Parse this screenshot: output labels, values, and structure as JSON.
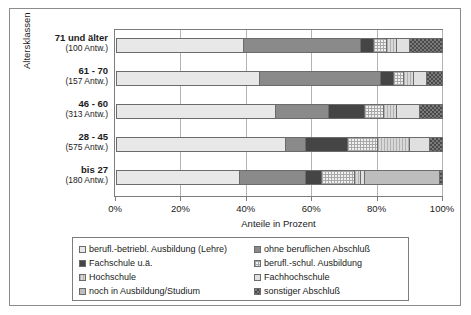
{
  "chart_data": {
    "type": "bar",
    "orientation": "horizontal",
    "stacked": true,
    "title": "",
    "xlabel": "Anteile in Prozent",
    "ylabel": "Altersklassen",
    "xlim": [
      0,
      100
    ],
    "xticks": [
      "0%",
      "20%",
      "40%",
      "60%",
      "80%",
      "100%"
    ],
    "xtick_values": [
      0,
      20,
      40,
      60,
      80,
      100
    ],
    "grid": true,
    "legend_position": "bottom",
    "categories": [
      "71 und älter",
      "61 - 70",
      "46 - 60",
      "28 - 45",
      "bis 27"
    ],
    "category_counts": [
      "(100 Antw.)",
      "(157 Antw.)",
      "(313 Antw.)",
      "(575 Antw.)",
      "(180 Antw.)"
    ],
    "series": [
      {
        "name": "berufl.-betriebl. Ausbildung (Lehre)",
        "pattern": "p-lehre",
        "values": [
          39,
          44,
          49,
          52,
          38
        ]
      },
      {
        "name": "ohne beruflichen Abschluß",
        "pattern": "p-ohne",
        "values": [
          36,
          37,
          16,
          6,
          20
        ]
      },
      {
        "name": "Fachschule u.ä.",
        "pattern": "p-fachsch",
        "values": [
          4,
          4,
          11,
          13,
          5
        ]
      },
      {
        "name": "berufl.-schul. Ausbildung",
        "pattern": "p-beschul",
        "values": [
          4,
          3,
          6,
          9,
          10
        ]
      },
      {
        "name": "Hochschule",
        "pattern": "p-hoch",
        "values": [
          3,
          3,
          4,
          10,
          2
        ]
      },
      {
        "name": "Fachhochschule",
        "pattern": "p-fachhoch",
        "values": [
          4,
          4,
          7,
          6,
          1
        ]
      },
      {
        "name": "noch in Ausbildung/Studium",
        "pattern": "p-noch",
        "values": [
          0,
          0,
          0,
          0,
          23
        ]
      },
      {
        "name": "sonstiger Abschluß",
        "pattern": "p-sonst",
        "values": [
          10,
          5,
          7,
          4,
          1
        ]
      }
    ]
  },
  "axes": {
    "x_title": "Anteile in Prozent",
    "y_title": "Altersklassen",
    "x_ticks": [
      {
        "label": "0%",
        "value": 0
      },
      {
        "label": "20%",
        "value": 20
      },
      {
        "label": "40%",
        "value": 40
      },
      {
        "label": "60%",
        "value": 60
      },
      {
        "label": "80%",
        "value": 80
      },
      {
        "label": "100%",
        "value": 100
      }
    ]
  },
  "legend": {
    "items": [
      {
        "label": "berufl.-betriebl. Ausbildung (Lehre)",
        "pattern": "p-lehre"
      },
      {
        "label": "ohne beruflichen Abschluß",
        "pattern": "p-ohne"
      },
      {
        "label": "Fachschule u.ä.",
        "pattern": "p-fachsch"
      },
      {
        "label": "berufl.-schul. Ausbildung",
        "pattern": "p-beschul"
      },
      {
        "label": "Hochschule",
        "pattern": "p-hoch"
      },
      {
        "label": "Fachhochschule",
        "pattern": "p-fachhoch"
      },
      {
        "label": "noch in Ausbildung/Studium",
        "pattern": "p-noch"
      },
      {
        "label": "sonstiger Abschluß",
        "pattern": "p-sonst"
      }
    ]
  },
  "colors": {
    "frame": "#8c8c8c",
    "axis": "#7d7d7d",
    "grid": "#b4b4b4",
    "text": "#1a1a1a"
  }
}
